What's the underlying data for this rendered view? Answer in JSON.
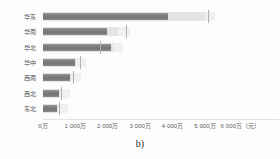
{
  "chart_data": {
    "type": "bar",
    "orientation": "horizontal",
    "title": "",
    "subtitle": "",
    "xlabel": "",
    "ylabel": "",
    "caption": "b)",
    "xlim": [
      0,
      6000
    ],
    "unit_suffix": "（元）",
    "grid": false,
    "legend": null,
    "categories": [
      "华东",
      "华南",
      "华北",
      "华中",
      "西南",
      "西北",
      "东北"
    ],
    "axis_ticks": [
      {
        "value": 0,
        "label": "0万"
      },
      {
        "value": 1000,
        "label": "1 000万"
      },
      {
        "value": 2000,
        "label": "2 000万"
      },
      {
        "value": 3000,
        "label": "3 000万"
      },
      {
        "value": 4000,
        "label": "4 000万"
      },
      {
        "value": 5000,
        "label": "5 000万"
      },
      {
        "value": 6000,
        "label": "6 000万（元）"
      }
    ],
    "series": [
      {
        "name": "measure",
        "values": [
          3850,
          1970,
          2100,
          980,
          830,
          490,
          430
        ]
      },
      {
        "name": "range",
        "values": [
          5000,
          2300,
          2160,
          1020,
          870,
          530,
          470
        ]
      },
      {
        "name": "target",
        "values": [
          5100,
          2560,
          1750,
          1140,
          930,
          560,
          500
        ]
      }
    ],
    "rows": [
      {
        "category": "华东",
        "measure": 3850,
        "range": 5000,
        "target": 5100
      },
      {
        "category": "华南",
        "measure": 1970,
        "range": 2300,
        "target": 2560
      },
      {
        "category": "华北",
        "measure": 2100,
        "range": 2160,
        "target": 1750
      },
      {
        "category": "华中",
        "measure": 980,
        "range": 1020,
        "target": 1140
      },
      {
        "category": "西南",
        "measure": 830,
        "range": 870,
        "target": 930
      },
      {
        "category": "西北",
        "measure": 490,
        "range": 530,
        "target": 560
      },
      {
        "category": "东北",
        "measure": 430,
        "range": 470,
        "target": 500
      }
    ],
    "colors": {
      "measure_bar": "#7e7e7e",
      "range_bar": "#e4e4e4",
      "track": "#f0f0f0",
      "target_tick": "#b0b0b0",
      "axis_line": "#e2e2e2",
      "label_text": "#4d4d4d",
      "axis_text": "#5a5a5a",
      "background": "#fdfdfd"
    }
  }
}
